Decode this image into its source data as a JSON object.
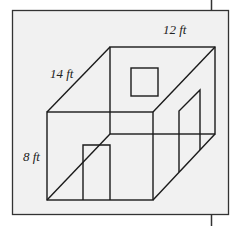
{
  "diagram": {
    "title": "",
    "type": "3D room wireframe (rectangular prism)",
    "dimensions": {
      "width": "12 ft",
      "length": "14 ft",
      "height": "8 ft"
    },
    "labels": [
      {
        "id": "width",
        "text": "12 ft"
      },
      {
        "id": "length",
        "text": "14 ft"
      },
      {
        "id": "height",
        "text": "8 ft"
      }
    ],
    "features": [
      {
        "id": "window",
        "location": "back wall",
        "shape": "square"
      },
      {
        "id": "front-door",
        "location": "front wall",
        "shape": "rectangle"
      },
      {
        "id": "side-door",
        "location": "right wall",
        "shape": "parallelogram"
      }
    ],
    "colors": {
      "panel_background": "#f1f1f1",
      "line": "#1a1a1a",
      "page_background": "#ffffff"
    }
  }
}
